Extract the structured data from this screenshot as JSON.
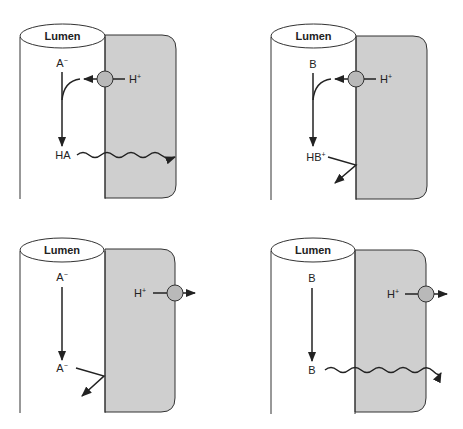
{
  "colors": {
    "cell_fill": "#cfcfcf",
    "pump_fill": "#b9b9b9",
    "stroke": "#333333",
    "background": "#ffffff"
  },
  "panels": [
    {
      "id": "top-left",
      "lumen_label": "Lumen",
      "top_species": {
        "base": "A",
        "sup": "−"
      },
      "bottom_species": {
        "base": "HA",
        "sup": ""
      },
      "pump_ion": {
        "base": "H",
        "sup": "+"
      },
      "pump_direction": "into-lumen",
      "bottom_fate": "diffuses-across-membrane"
    },
    {
      "id": "top-right",
      "lumen_label": "Lumen",
      "top_species": {
        "base": "B",
        "sup": ""
      },
      "bottom_species": {
        "base": "HB",
        "sup": "+"
      },
      "pump_ion": {
        "base": "H",
        "sup": "+"
      },
      "pump_direction": "into-lumen",
      "bottom_fate": "reflected-at-membrane"
    },
    {
      "id": "bottom-left",
      "lumen_label": "Lumen",
      "top_species": {
        "base": "A",
        "sup": "−"
      },
      "bottom_species": {
        "base": "A",
        "sup": "−"
      },
      "pump_ion": {
        "base": "H",
        "sup": "+"
      },
      "pump_direction": "out-of-cell",
      "bottom_fate": "reflected-at-membrane"
    },
    {
      "id": "bottom-right",
      "lumen_label": "Lumen",
      "top_species": {
        "base": "B",
        "sup": ""
      },
      "bottom_species": {
        "base": "B",
        "sup": ""
      },
      "pump_ion": {
        "base": "H",
        "sup": "+"
      },
      "pump_direction": "out-of-cell",
      "bottom_fate": "diffuses-across-membrane"
    }
  ]
}
